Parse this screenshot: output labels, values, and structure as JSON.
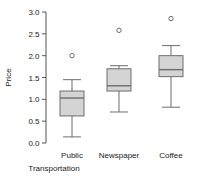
{
  "chart_data": {
    "type": "box",
    "title": "",
    "xlabel": "",
    "ylabel": "Price",
    "ylim": [
      0.0,
      3.0
    ],
    "ytick_labels": [
      "0.0",
      "0.5",
      "1.0",
      "1.5",
      "2.0",
      "2.5",
      "3.0"
    ],
    "ytick_values": [
      0.0,
      0.5,
      1.0,
      1.5,
      2.0,
      2.5,
      3.0
    ],
    "grid": false,
    "legend": "none",
    "categories": [
      "Public Transportation",
      "Newspaper",
      "Coffee"
    ],
    "boxes": [
      {
        "category": "Public Transportation",
        "label_line1": "Public",
        "label_line2": "Transportation",
        "whisker_low": 0.14,
        "q1": 0.62,
        "median": 1.03,
        "q3": 1.19,
        "whisker_high": 1.45,
        "outliers": [
          2.0
        ]
      },
      {
        "category": "Newspaper",
        "label_line1": "Newspaper",
        "label_line2": "",
        "whisker_low": 0.71,
        "q1": 1.19,
        "median": 1.31,
        "q3": 1.7,
        "whisker_high": 1.77,
        "outliers": [
          2.58
        ]
      },
      {
        "category": "Coffee",
        "label_line1": "Coffee",
        "label_line2": "",
        "whisker_low": 0.82,
        "q1": 1.52,
        "median": 1.68,
        "q3": 2.0,
        "whisker_high": 2.23,
        "outliers": [
          2.85
        ]
      }
    ],
    "colors": {
      "box_fill": "#d4d4d4",
      "box_stroke": "#6d6d6d",
      "axis": "#555555",
      "text": "#1a1a1a",
      "background": "#ffffff"
    }
  }
}
